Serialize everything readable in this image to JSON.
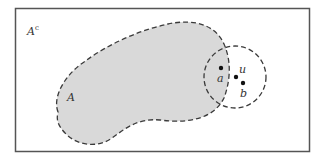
{
  "diagram": {
    "universe_label": "A",
    "universe_superscript": "c",
    "set_label": "A",
    "points": [
      {
        "name": "a",
        "label": "a"
      },
      {
        "name": "u",
        "label": "u"
      },
      {
        "name": "b",
        "label": "b"
      }
    ],
    "colors": {
      "set_fill": "#d9d9d9",
      "outline": "#3a3a3a",
      "frame": "#555555",
      "background": "#ffffff"
    }
  }
}
